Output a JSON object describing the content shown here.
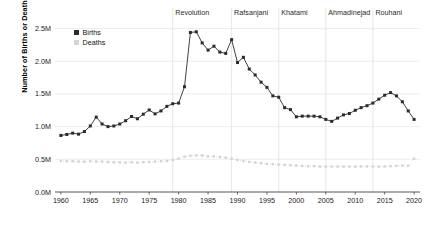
{
  "chart_data": {
    "type": "line",
    "title": "",
    "xlabel": "",
    "ylabel": "Number of Births or Deaths",
    "xlim": [
      1959,
      2021
    ],
    "ylim": [
      0,
      2600000
    ],
    "grid": true,
    "grid_axis": "y",
    "legend_position": "top-left-inside",
    "ytick_labels": [
      "0.0M",
      "0.5M",
      "1.0M",
      "1.5M",
      "2.0M",
      "2.5M"
    ],
    "ytick_values": [
      0,
      500000,
      1000000,
      1500000,
      2000000,
      2500000
    ],
    "xtick_labels": [
      "1960",
      "1965",
      "1970",
      "1975",
      "1980",
      "1985",
      "1990",
      "1995",
      "2000",
      "2005",
      "2010",
      "2015",
      "2020"
    ],
    "xtick_values": [
      1960,
      1965,
      1970,
      1975,
      1980,
      1985,
      1990,
      1995,
      2000,
      2005,
      2010,
      2015,
      2020
    ],
    "x": [
      1960,
      1961,
      1962,
      1963,
      1964,
      1965,
      1966,
      1967,
      1968,
      1969,
      1970,
      1971,
      1972,
      1973,
      1974,
      1975,
      1976,
      1977,
      1978,
      1979,
      1980,
      1981,
      1982,
      1983,
      1984,
      1985,
      1986,
      1987,
      1988,
      1989,
      1990,
      1991,
      1992,
      1993,
      1994,
      1995,
      1996,
      1997,
      1998,
      1999,
      2000,
      2001,
      2002,
      2003,
      2004,
      2005,
      2006,
      2007,
      2008,
      2009,
      2010,
      2011,
      2012,
      2013,
      2014,
      2015,
      2016,
      2017,
      2018,
      2019,
      2020
    ],
    "series": [
      {
        "name": "Births",
        "color": "#2b2b2b",
        "marker": "square",
        "linestyle": "solid",
        "values": [
          865000,
          880000,
          900000,
          885000,
          925000,
          1010000,
          1145000,
          1040000,
          1000000,
          1010000,
          1040000,
          1090000,
          1155000,
          1120000,
          1190000,
          1255000,
          1195000,
          1240000,
          1310000,
          1350000,
          1360000,
          1610000,
          2440000,
          2450000,
          2280000,
          2170000,
          2230000,
          2140000,
          2120000,
          2330000,
          1980000,
          2060000,
          1880000,
          1790000,
          1680000,
          1600000,
          1470000,
          1450000,
          1290000,
          1260000,
          1150000,
          1160000,
          1160000,
          1160000,
          1150000,
          1110000,
          1080000,
          1130000,
          1180000,
          1200000,
          1250000,
          1290000,
          1320000,
          1360000,
          1420000,
          1480000,
          1520000,
          1470000,
          1380000,
          1240000,
          1110000
        ]
      },
      {
        "name": "Deaths",
        "color": "#d3d3d3",
        "marker": "square",
        "linestyle": "dotted",
        "values": [
          475000,
          470000,
          470000,
          465000,
          465000,
          470000,
          465000,
          465000,
          460000,
          455000,
          455000,
          450000,
          455000,
          450000,
          455000,
          460000,
          465000,
          470000,
          475000,
          490000,
          510000,
          540000,
          555000,
          560000,
          560000,
          545000,
          545000,
          535000,
          525000,
          510000,
          490000,
          475000,
          460000,
          450000,
          440000,
          430000,
          425000,
          420000,
          415000,
          410000,
          405000,
          400000,
          395000,
          395000,
          390000,
          390000,
          390000,
          390000,
          390000,
          390000,
          390000,
          390000,
          390000,
          390000,
          390000,
          390000,
          395000,
          400000,
          405000,
          400000,
          510000
        ]
      }
    ],
    "annotations": [
      {
        "label": "Revolution",
        "x": 1979
      },
      {
        "label": "Rafsanjani",
        "x": 1989
      },
      {
        "label": "Khatami",
        "x": 1997
      },
      {
        "label": "Ahmadinejad",
        "x": 2005
      },
      {
        "label": "Rouhani",
        "x": 2013
      }
    ]
  },
  "legend": {
    "items": [
      {
        "label": "Births",
        "color": "#2b2b2b"
      },
      {
        "label": "Deaths",
        "color": "#d3d3d3"
      }
    ]
  },
  "axes": {
    "y_title": "Number of Births or Deaths"
  },
  "colors": {
    "births": "#2b2b2b",
    "deaths": "#d3d3d3",
    "grid": "#e9e9e9",
    "divider": "#e4e4e4",
    "axis": "#444444",
    "text": "#1a1a1a"
  }
}
